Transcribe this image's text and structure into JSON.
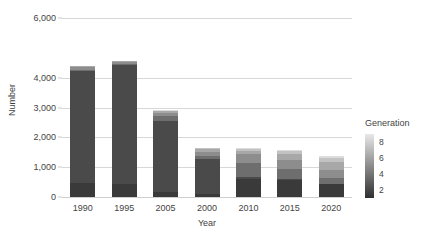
{
  "chart_data": {
    "type": "bar",
    "stacked": true,
    "title": "",
    "xlabel": "Year",
    "ylabel": "Number",
    "categories": [
      "1990",
      "1995",
      "2005",
      "2000",
      "2010",
      "2015",
      "2020"
    ],
    "ylim": [
      0,
      6000
    ],
    "yticks": [
      0,
      1000,
      2000,
      3000,
      4000,
      6000
    ],
    "ytick_labels": [
      "0",
      "1,000",
      "2,000",
      "3,000",
      "4,000",
      "6,000"
    ],
    "grid": true,
    "grid_axis": "y",
    "legend": {
      "title": "Generation",
      "position": "right",
      "type": "colorbar-continuous",
      "ticks": [
        2,
        4,
        6,
        8
      ],
      "tick_labels": [
        "2",
        "4",
        "6",
        "8"
      ],
      "vmin": 1,
      "vmax": 9,
      "low_color": "#2f2f2f",
      "high_color": "#e8e8e8"
    },
    "series": [
      {
        "name": "2",
        "generation": 2,
        "color": "#3a3a3a",
        "values": [
          470,
          450,
          160,
          90,
          600,
          570,
          420
        ]
      },
      {
        "name": "3",
        "generation": 3,
        "color": "#4a4a4a",
        "values": [
          3740,
          3960,
          2400,
          1190,
          60,
          40,
          30
        ]
      },
      {
        "name": "4",
        "generation": 4,
        "color": "#6e6e6e",
        "values": [
          60,
          40,
          140,
          100,
          480,
          340,
          190
        ]
      },
      {
        "name": "5",
        "generation": 5,
        "color": "#8d8d8d",
        "values": [
          80,
          70,
          130,
          130,
          290,
          300,
          280
        ]
      },
      {
        "name": "6",
        "generation": 6,
        "color": "#a8a8a8",
        "values": [
          30,
          30,
          50,
          90,
          130,
          190,
          250
        ]
      },
      {
        "name": "7",
        "generation": 7,
        "color": "#c2c2c2",
        "values": [
          10,
          10,
          20,
          40,
          50,
          90,
          130
        ]
      },
      {
        "name": "8",
        "generation": 8,
        "color": "#dcdcdc",
        "values": [
          10,
          10,
          10,
          20,
          30,
          50,
          70
        ]
      }
    ],
    "totals": [
      4400,
      4570,
      2910,
      1660,
      1640,
      1580,
      1370
    ]
  }
}
